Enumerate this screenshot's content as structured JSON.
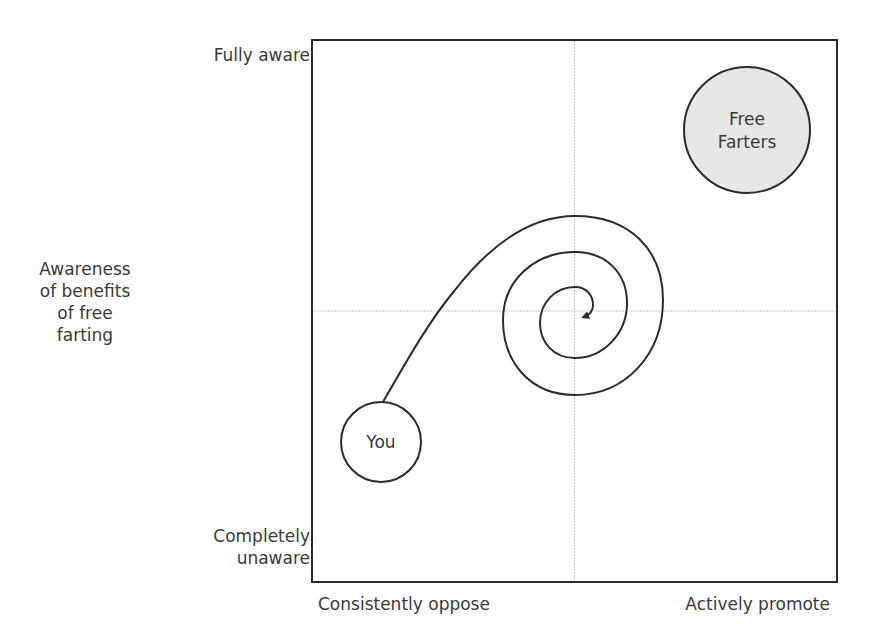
{
  "diagram": {
    "y_axis": {
      "title_lines": [
        "Awareness",
        "of benefits",
        "of free",
        "farting"
      ],
      "top_label": "Fully aware",
      "bottom_label_lines": [
        "Completely",
        "unaware"
      ]
    },
    "x_axis": {
      "left_label": "Consistently oppose",
      "right_label": "Actively promote"
    },
    "nodes": {
      "you": {
        "label": "You",
        "fill": "#ffffff"
      },
      "free_farters": {
        "label_lines": [
          "Free",
          "Farters"
        ],
        "fill": "#e6e6e6"
      }
    },
    "path": {
      "type": "spiral",
      "from": "You",
      "direction": "inward toward center",
      "arrow": "end"
    },
    "colors": {
      "border": "#2b2b2b",
      "gridline": "#c8c8c8",
      "text": "#3a3a3a"
    }
  }
}
